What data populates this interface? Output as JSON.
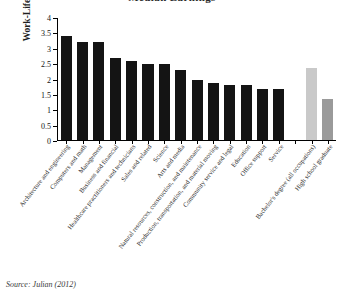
{
  "chart_data": {
    "type": "bar",
    "title": "Median Earnings",
    "xlabel": "",
    "ylabel": "Work-Life Earnings, in $Millions",
    "ylim": [
      0,
      4
    ],
    "ytick_labels": [
      "0",
      "0.5",
      "1",
      "1.5",
      "2",
      "2.5",
      "3",
      "3.5",
      "4"
    ],
    "ytick_values": [
      0,
      0.5,
      1,
      1.5,
      2,
      2.5,
      3,
      3.5,
      4
    ],
    "grid": false,
    "legend": "none",
    "categories": [
      "Architecture and engineering",
      "Computers and math",
      "Management",
      "Business and financial",
      "Healthcare practitioners and technicians",
      "Sales and related",
      "Science",
      "Arts and media",
      "Natural resources, construction, and maintenance",
      "Production, transportation, and material moving",
      "Community service and legal",
      "Education",
      "Office support",
      "Service",
      "",
      "Bachelor's degree (all occupations)",
      "High school graduate"
    ],
    "values": [
      3.4,
      3.2,
      3.2,
      2.68,
      2.6,
      2.48,
      2.48,
      2.3,
      1.98,
      1.88,
      1.8,
      1.8,
      1.68,
      1.66,
      null,
      2.37,
      1.36
    ],
    "bar_styles": [
      "occupation",
      "occupation",
      "occupation",
      "occupation",
      "occupation",
      "occupation",
      "occupation",
      "occupation",
      "occupation",
      "occupation",
      "occupation",
      "occupation",
      "occupation",
      "occupation",
      "gap",
      "education-light",
      "education-dark"
    ],
    "colors": {
      "occupation": "#141414",
      "education_light": "#c9c9c9",
      "education_dark": "#9a9a9a",
      "axis": "#000000"
    }
  },
  "caption": {
    "source": "Source: Julian (2012)"
  }
}
